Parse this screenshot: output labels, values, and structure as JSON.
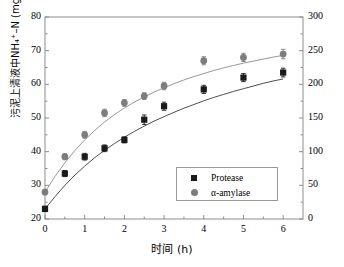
{
  "chart_data": {
    "type": "scatter",
    "title": "",
    "xlabel": "时间 (h)",
    "ylabel": "污泥上清液中NH₄⁺–N (mg/L)",
    "ylabel_right": "",
    "xlim": [
      0,
      6.5
    ],
    "ylim": [
      20,
      80
    ],
    "ylim_right": [
      0,
      300
    ],
    "xticks": [
      0,
      1,
      2,
      3,
      4,
      5,
      6
    ],
    "xticklabels": [
      "0",
      "1",
      "2",
      "3",
      "4",
      "5",
      "6"
    ],
    "yticks": [
      20,
      30,
      40,
      50,
      60,
      70,
      80
    ],
    "yticklabels": [
      "20",
      "30",
      "40",
      "50",
      "60",
      "70",
      "80"
    ],
    "yticks_right": [
      0,
      50,
      100,
      150,
      200,
      250,
      300
    ],
    "yticklabels_right": [
      "0",
      "50",
      "100",
      "150",
      "200",
      "250",
      "300"
    ],
    "grid": false,
    "minor_ticks": true,
    "legend_position": "lower right",
    "series": [
      {
        "name": "Protease",
        "marker": "square",
        "color": "#1a1a1a",
        "line_color": "#3a3a3a",
        "x": [
          0,
          0.5,
          1.0,
          1.5,
          2.0,
          2.5,
          3.0,
          4.0,
          5.0,
          6.0
        ],
        "y": [
          23.0,
          33.5,
          38.5,
          41.0,
          43.5,
          49.5,
          53.5,
          58.5,
          62.0,
          63.5
        ],
        "yerr": [
          0.8,
          0.9,
          1.0,
          1.0,
          0.9,
          1.4,
          1.2,
          1.2,
          1.2,
          1.3
        ]
      },
      {
        "name": "α-amylase",
        "marker": "circle",
        "color": "#7d7d7d",
        "line_color": "#8c8c8c",
        "x": [
          0,
          0.5,
          1.0,
          1.5,
          2.0,
          2.5,
          3.0,
          4.0,
          5.0,
          6.0
        ],
        "y": [
          28.0,
          38.5,
          45.0,
          51.5,
          54.5,
          56.5,
          59.5,
          67.0,
          68.0,
          69.0
        ],
        "yerr": [
          0.8,
          0.9,
          1.0,
          1.1,
          1.0,
          1.0,
          1.1,
          1.2,
          1.2,
          1.4
        ]
      }
    ],
    "fit_curves": [
      {
        "name": "Protease fit",
        "color": "#3a3a3a",
        "points_x": [
          0,
          0.25,
          0.5,
          0.75,
          1.0,
          1.25,
          1.5,
          1.75,
          2.0,
          2.25,
          2.5,
          2.75,
          3.0,
          3.25,
          3.5,
          3.75,
          4.0,
          4.25,
          4.5,
          4.75,
          5.0,
          5.25,
          5.5,
          5.75,
          6.0
        ],
        "points_y": [
          23.0,
          26.6,
          30.0,
          33.0,
          35.7,
          38.2,
          40.4,
          42.4,
          44.3,
          46.0,
          47.6,
          49.1,
          50.4,
          51.7,
          52.9,
          54.0,
          55.1,
          56.1,
          57.0,
          57.9,
          58.7,
          59.5,
          60.3,
          61.0,
          61.6
        ]
      },
      {
        "name": "α-amylase fit",
        "color": "#8c8c8c",
        "points_x": [
          0,
          0.25,
          0.5,
          0.75,
          1.0,
          1.25,
          1.5,
          1.75,
          2.0,
          2.25,
          2.5,
          2.75,
          3.0,
          3.25,
          3.5,
          3.75,
          4.0,
          4.25,
          4.5,
          4.75,
          5.0,
          5.25,
          5.5,
          5.75,
          6.0
        ],
        "points_y": [
          28.0,
          32.6,
          36.7,
          40.3,
          43.5,
          46.3,
          48.8,
          51.0,
          53.0,
          54.7,
          56.3,
          57.7,
          59.0,
          60.2,
          61.3,
          62.3,
          63.2,
          64.1,
          64.9,
          65.6,
          66.3,
          66.9,
          67.5,
          68.1,
          68.6
        ]
      }
    ],
    "legend": [
      {
        "label": "Protease",
        "marker": "square",
        "color": "#1a1a1a"
      },
      {
        "label": "α-amylase",
        "marker": "circle",
        "color": "#7d7d7d"
      }
    ]
  },
  "axes": {
    "frame_color": "#8d8d8d"
  }
}
